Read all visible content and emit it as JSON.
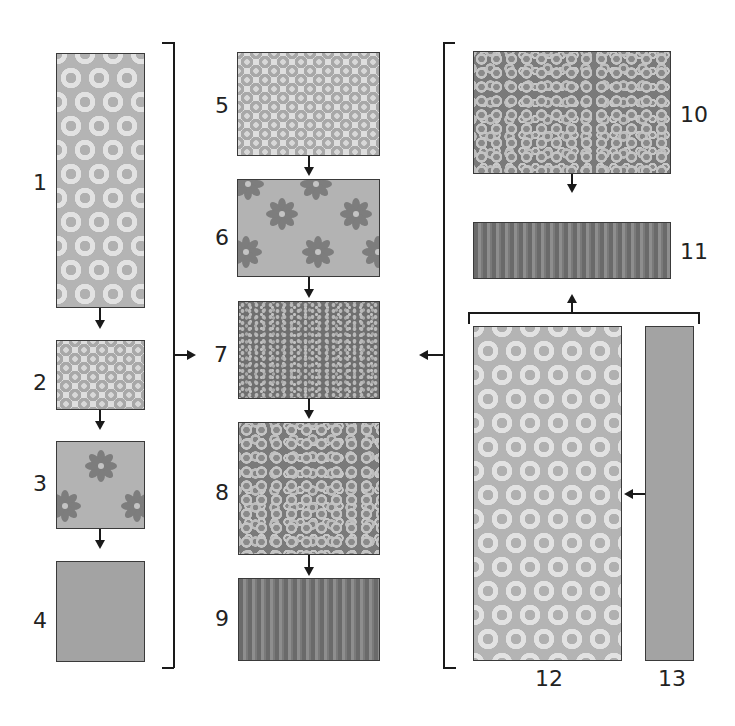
{
  "diagram": {
    "type": "quilt-fabric-assembly-flow",
    "groups": [
      {
        "id": "left",
        "items": [
          "1",
          "2",
          "3",
          "4"
        ],
        "output_arrow": "right",
        "feeds": "7"
      },
      {
        "id": "middle",
        "items": [
          "5",
          "6",
          "7",
          "8",
          "9"
        ]
      },
      {
        "id": "right",
        "items": [
          "10",
          "11",
          "12",
          "13"
        ],
        "output_arrow": "left",
        "feeds": "7"
      }
    ],
    "swatches": [
      {
        "label": "1",
        "pattern": "large-rings",
        "color": "#b4b4b4"
      },
      {
        "label": "2",
        "pattern": "small-rings",
        "color": "#dedede"
      },
      {
        "label": "3",
        "pattern": "flowers",
        "color": "#b3b3b3"
      },
      {
        "label": "4",
        "pattern": "solid",
        "color": "#a3a3a3"
      },
      {
        "label": "5",
        "pattern": "small-rings",
        "color": "#dedede"
      },
      {
        "label": "6",
        "pattern": "flowers",
        "color": "#b3b3b3"
      },
      {
        "label": "7",
        "pattern": "speckle",
        "color": "#6f6f6f"
      },
      {
        "label": "8",
        "pattern": "cells",
        "color": "#7a7a7a"
      },
      {
        "label": "9",
        "pattern": "stripes",
        "color": "#6c6c6c"
      },
      {
        "label": "10",
        "pattern": "cells",
        "color": "#7a7a7a"
      },
      {
        "label": "11",
        "pattern": "stripes",
        "color": "#6c6c6c"
      },
      {
        "label": "12",
        "pattern": "large-rings",
        "color": "#b4b4b4"
      },
      {
        "label": "13",
        "pattern": "solid",
        "color": "#a3a3a3"
      }
    ],
    "connections": [
      {
        "from": "1",
        "to": "2"
      },
      {
        "from": "2",
        "to": "3"
      },
      {
        "from": "3",
        "to": "4"
      },
      {
        "from": "5",
        "to": "6"
      },
      {
        "from": "6",
        "to": "7"
      },
      {
        "from": "7",
        "to": "8"
      },
      {
        "from": "8",
        "to": "9"
      },
      {
        "from": "10",
        "to": "11"
      },
      {
        "from": "13",
        "to": "12"
      },
      {
        "from": "12+13",
        "to": "11"
      },
      {
        "from": "left-group",
        "to": "7"
      },
      {
        "from": "right-group",
        "to": "7"
      }
    ],
    "flower_color": "#7d7d7d",
    "line_color": "#1a1a1a"
  }
}
